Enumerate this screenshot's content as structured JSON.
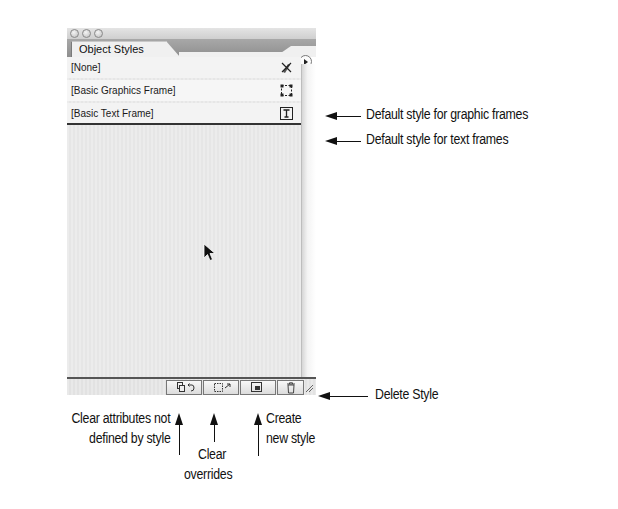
{
  "panel": {
    "tab_label": "Object Styles",
    "window_controls": [
      "close",
      "minimize",
      "zoom"
    ],
    "menu_icon": "panel-menu-icon",
    "rows": [
      {
        "label": "[None]",
        "icon": "no-style-pen-icon"
      },
      {
        "label": "[Basic Graphics Frame]",
        "icon": "graphics-frame-icon"
      },
      {
        "label": "[Basic Text Frame]",
        "icon": "text-frame-icon"
      }
    ],
    "footer_buttons": [
      {
        "name": "clear-attributes-not-defined-button",
        "icon": "clear-attributes-icon"
      },
      {
        "name": "clear-overrides-button",
        "icon": "clear-overrides-icon"
      },
      {
        "name": "create-new-style-button",
        "icon": "new-style-icon"
      },
      {
        "name": "delete-style-button",
        "icon": "trash-icon"
      }
    ]
  },
  "callouts": {
    "graphics_frame": "Default style for graphic frames",
    "text_frame": "Default style for text frames",
    "delete_style": "Delete Style",
    "clear_attributes_line1": "Clear attributes not",
    "clear_attributes_line2": "defined by style",
    "clear_overrides_line1": "Clear",
    "clear_overrides_line2": "overrides",
    "create_new_line1": "Create",
    "create_new_line2": "new style"
  }
}
